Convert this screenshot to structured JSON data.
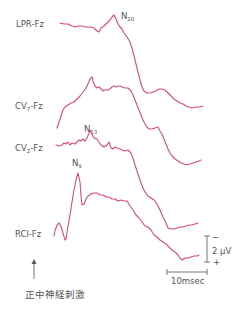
{
  "figure": {
    "trace_color": "#d64b73",
    "channels": [
      {
        "label": "LPR-Fz",
        "base": "LPR",
        "sub": "",
        "rest": "-Fz",
        "peak_label": "N",
        "peak_sub": "20"
      },
      {
        "label": "CV7-Fz",
        "base": "CV",
        "sub": "7",
        "rest": "-Fz",
        "peak_label": "",
        "peak_sub": ""
      },
      {
        "label": "CV2-Fz",
        "base": "CV",
        "sub": "2",
        "rest": "-Fz",
        "peak_label": "N",
        "peak_sub": "13"
      },
      {
        "label": "RCl-Fz",
        "base": "RCl-Fz",
        "sub": "",
        "rest": "",
        "peak_label": "N",
        "peak_sub": "9"
      }
    ],
    "scale_bar": {
      "amplitude": "2 μV",
      "minus": "−",
      "plus": "+",
      "time": "10msec"
    },
    "stimulus_label": "正中神経刺激"
  }
}
